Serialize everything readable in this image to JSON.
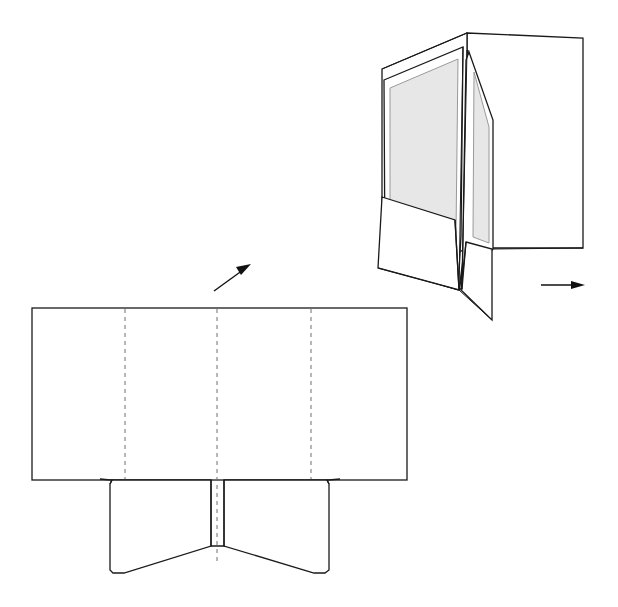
{
  "figure": {
    "title": "Presentation folder assembly diagram",
    "background_color": "#ffffff",
    "line_color": "#1a1a1a",
    "fold_line_color": "#6e6e6e",
    "liner_fill_color": "#e7e7e7",
    "liner_edge_color": "#9a9a9a",
    "width": 618,
    "height": 607
  },
  "chart_data": {
    "type": "diagram",
    "title": "Presentation folder assembly diagram",
    "parts": [
      {
        "id": "flat-blank",
        "label": "Flat die-cut blank",
        "description": "Unfolded folder blank with four panels separated by three vertical dashed score lines and two trapezoidal pocket flaps below a horizontal dashed score line"
      },
      {
        "id": "assembled-folder",
        "label": "Assembled folder, perspective view",
        "description": "Open two-pocket presentation folder with grey inner liner panels and a back panel folded out to the right"
      }
    ],
    "annotations": [
      {
        "id": "arrow-assemble",
        "type": "arrow",
        "direction": "up-right",
        "from": [
          215,
          291
        ],
        "to": [
          251,
          265
        ]
      },
      {
        "id": "arrow-close",
        "type": "arrow",
        "direction": "right",
        "from": [
          541,
          285
        ],
        "to": [
          585,
          285
        ]
      }
    ]
  },
  "flat_blank": {
    "name": "flat-die-cut-blank",
    "body": {
      "x": 32,
      "y": 308,
      "width": 375,
      "height": 172
    },
    "fold_lines_vertical_x": [
      125,
      217,
      311
    ],
    "fold_line_horizontal_y": 480,
    "panels": [
      {
        "id": "panel-left-cover",
        "x_range": [
          32,
          125
        ]
      },
      {
        "id": "panel-left-inner",
        "x_range": [
          125,
          217
        ]
      },
      {
        "id": "panel-right-inner",
        "x_range": [
          217,
          311
        ]
      },
      {
        "id": "panel-right-cover",
        "x_range": [
          311,
          407
        ]
      }
    ],
    "pocket_flaps": [
      {
        "id": "pocket-flap-left",
        "top_y": 480,
        "bottom_y": 573,
        "left_x": 113,
        "right_x": 211
      },
      {
        "id": "pocket-flap-right",
        "top_y": 480,
        "bottom_y": 573,
        "left_x": 224,
        "right_x": 324
      }
    ],
    "center_slot": {
      "x_range": [
        211,
        224
      ],
      "top_y": 480,
      "bottom_y": 546
    }
  },
  "assembled_folder": {
    "name": "assembled-folder-perspective",
    "spine_top": [
      467,
      33
    ],
    "left_panel": {
      "top_left": [
        382,
        69
      ],
      "top_right": [
        467,
        33
      ]
    },
    "back_panel": {
      "x_range": [
        467,
        583
      ],
      "y_range": [
        38,
        248
      ]
    },
    "liners": [
      {
        "id": "liner-left",
        "fill": "#e7e7e7"
      },
      {
        "id": "liner-right",
        "fill": "#e7e7e7"
      }
    ],
    "pockets": [
      {
        "id": "pocket-front-left"
      },
      {
        "id": "pocket-front-right"
      }
    ]
  },
  "arrows": {
    "assemble": {
      "name": "assembly-direction-arrow",
      "direction": "up-right"
    },
    "close": {
      "name": "closing-direction-arrow",
      "direction": "right"
    }
  }
}
